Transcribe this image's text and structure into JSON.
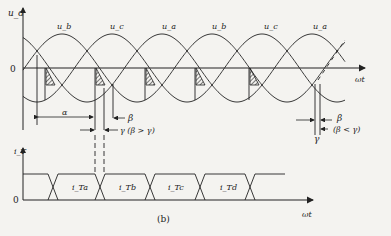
{
  "figure": {
    "caption": "(b)",
    "upper_plot": {
      "y_axis_label": "u_d",
      "x_axis_label": "ωt",
      "origin_label": "0",
      "waveform_labels": [
        "u_b",
        "u_c",
        "u_a",
        "u_b",
        "u_c",
        "u_a"
      ],
      "annotations": {
        "alpha": "α",
        "beta_top": "β",
        "gamma_case1": "γ (β > γ)",
        "beta_right": "β",
        "gamma_right": "γ",
        "case2": "(β < γ)"
      }
    },
    "lower_plot": {
      "y_axis_label": "i_T",
      "x_axis_label": "ωt",
      "origin_label": "0",
      "pulse_labels": [
        "i_Ta",
        "i_Tb",
        "i_Tc",
        "i_Td"
      ]
    }
  }
}
